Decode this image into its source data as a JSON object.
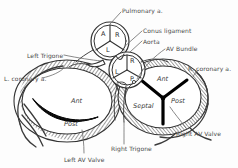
{
  "figure": {
    "background_color": "#fdfdfd",
    "ink_color": "#333333",
    "leader_color": "#6b6b6b"
  },
  "callouts": [
    {
      "id": "pulmonary-artery",
      "text": "Pulmonary a.",
      "x": 122,
      "y": 8
    },
    {
      "id": "conus-ligament",
      "text": "Conus ligament",
      "x": 143,
      "y": 28
    },
    {
      "id": "aorta",
      "text": "Aorta",
      "x": 143,
      "y": 39
    },
    {
      "id": "av-bundle",
      "text": "AV Bundle",
      "x": 166,
      "y": 46
    },
    {
      "id": "left-trigone",
      "text": "Left Trigone",
      "x": 27,
      "y": 53
    },
    {
      "id": "left-coronary",
      "text": "L. coronary a.",
      "x": 4,
      "y": 76
    },
    {
      "id": "right-coronary",
      "text": "R. coronary a.",
      "x": 188,
      "y": 66
    },
    {
      "id": "right-av-valve",
      "text": "Right AV Valve",
      "x": 176,
      "y": 131
    },
    {
      "id": "right-trigone",
      "text": "Right Trigone",
      "x": 111,
      "y": 146
    },
    {
      "id": "left-av-valve",
      "text": "Left AV Valve",
      "x": 64,
      "y": 157
    }
  ],
  "pulmonary_valve": {
    "name": "pulmonary-valve",
    "center_x": 110,
    "center_y": 41,
    "radius": 17,
    "cusps": [
      {
        "id": "anterior",
        "label": "A",
        "x": 101,
        "y": 31
      },
      {
        "id": "right",
        "label": "R",
        "x": 115,
        "y": 32
      },
      {
        "id": "left",
        "label": "L",
        "x": 106,
        "y": 47
      }
    ]
  },
  "aortic_valve": {
    "name": "aortic-valve",
    "center_x": 127,
    "center_y": 70,
    "radius": 16,
    "cusps": [
      {
        "id": "right",
        "label": "R",
        "x": 130,
        "y": 58
      },
      {
        "id": "left",
        "label": "L",
        "x": 115,
        "y": 69
      },
      {
        "id": "posterior",
        "label": "P",
        "x": 130,
        "y": 76
      }
    ]
  },
  "left_av_valve": {
    "name": "left-av-valve",
    "leaflets": [
      {
        "id": "anterior",
        "label": "Ant",
        "x": 71,
        "y": 98
      },
      {
        "id": "posterior",
        "label": "Post",
        "x": 64,
        "y": 121
      }
    ]
  },
  "right_av_valve": {
    "name": "right-av-valve",
    "leaflets": [
      {
        "id": "anterior",
        "label": "Ant",
        "x": 157,
        "y": 76
      },
      {
        "id": "posterior",
        "label": "Post",
        "x": 171,
        "y": 98
      },
      {
        "id": "septal",
        "label": "Septal",
        "x": 136,
        "y": 103
      }
    ]
  }
}
